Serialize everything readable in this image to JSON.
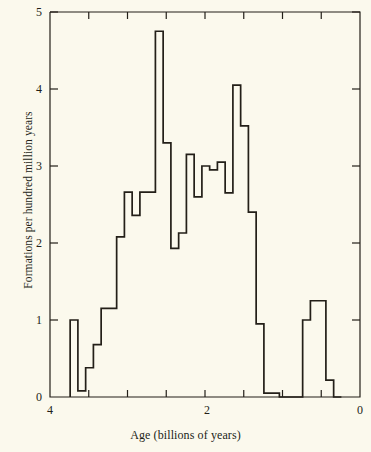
{
  "chart_data": {
    "type": "bar",
    "title": "",
    "subtitle": "",
    "xlabel": "Age (billions of years)",
    "ylabel": "Formations per hundred million years",
    "xlim": [
      4,
      0
    ],
    "ylim": [
      0,
      5
    ],
    "x_axis_reversed": true,
    "grid": false,
    "legend": null,
    "annotations": [],
    "xticks": [
      4,
      2,
      0
    ],
    "xtick_labels": [
      "4",
      "2",
      "0"
    ],
    "xtick_minor": [
      3.5,
      3,
      2.5,
      1.5,
      1,
      0.5
    ],
    "yticks": [
      0,
      1,
      2,
      3,
      4,
      5
    ],
    "ytick_labels": [
      "0",
      "1",
      "2",
      "3",
      "4",
      "5"
    ],
    "bin_width": 0.1,
    "bin_starts": [
      3.74,
      3.64,
      3.54,
      3.44,
      3.34,
      3.24,
      3.14,
      3.04,
      2.94,
      2.84,
      2.74,
      2.64,
      2.54,
      2.44,
      2.34,
      2.24,
      2.14,
      2.04,
      1.94,
      1.84,
      1.74,
      1.64,
      1.54,
      1.44,
      1.34,
      1.24,
      1.14,
      1.04,
      0.94,
      0.84,
      0.74,
      0.64,
      0.54,
      0.44,
      0.34
    ],
    "categories": [
      "3.74-3.64",
      "3.64-3.54",
      "3.54-3.44",
      "3.44-3.34",
      "3.34-3.24",
      "3.24-3.14",
      "3.14-3.04",
      "3.04-2.94",
      "2.94-2.84",
      "2.84-2.74",
      "2.74-2.64",
      "2.64-2.54",
      "2.54-2.44",
      "2.44-2.34",
      "2.34-2.24",
      "2.24-2.14",
      "2.14-2.04",
      "2.04-1.94",
      "1.94-1.84",
      "1.84-1.74",
      "1.74-1.64",
      "1.64-1.54",
      "1.54-1.44",
      "1.44-1.34",
      "1.34-1.24",
      "1.24-1.14",
      "1.14-1.04",
      "1.04-0.94",
      "0.94-0.84",
      "0.84-0.74",
      "0.74-0.64",
      "0.64-0.54",
      "0.54-0.44",
      "0.44-0.34",
      "0.34-0.24"
    ],
    "values": [
      1.0,
      0.08,
      0.38,
      0.68,
      1.15,
      1.15,
      2.08,
      2.66,
      2.36,
      2.66,
      2.66,
      4.75,
      3.3,
      1.93,
      2.13,
      3.15,
      2.6,
      3.0,
      2.95,
      3.05,
      2.65,
      4.05,
      3.52,
      2.4,
      0.95,
      0.05,
      0.05,
      0.0,
      0.0,
      0.0,
      1.0,
      1.25,
      1.25,
      0.22,
      0.0
    ],
    "colors": {
      "background": "#fbf9ed",
      "line": "#231f18",
      "axis": "#231f18"
    }
  }
}
